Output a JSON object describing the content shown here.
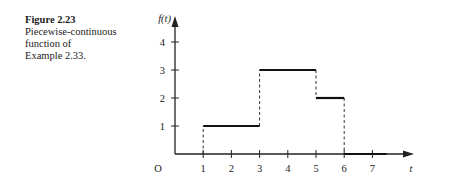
{
  "caption": {
    "figure_label": "Figure 2.23",
    "lines": [
      "Piecewise-continuous",
      "function of",
      "Example 2.33."
    ]
  },
  "chart_data": {
    "type": "line",
    "subtype": "step",
    "title": "",
    "xlabel": "t",
    "ylabel": "f(t)",
    "origin_label": "O",
    "x_ticks": [
      1,
      2,
      3,
      4,
      5,
      6,
      7
    ],
    "y_ticks": [
      1,
      2,
      3,
      4
    ],
    "xlim": [
      0,
      8
    ],
    "ylim": [
      0,
      4.5
    ],
    "grid": false,
    "segments": [
      {
        "x_start": 1,
        "x_end": 3,
        "y": 1
      },
      {
        "x_start": 3,
        "x_end": 5,
        "y": 3
      },
      {
        "x_start": 5,
        "x_end": 6,
        "y": 2
      },
      {
        "x_start": 6,
        "x_end": 7.5,
        "y": 0
      }
    ],
    "discontinuities": [
      {
        "x": 1,
        "from": 0,
        "to": 1
      },
      {
        "x": 3,
        "from": 1,
        "to": 3
      },
      {
        "x": 5,
        "from": 3,
        "to": 2
      },
      {
        "x": 6,
        "from": 2,
        "to": 0
      }
    ]
  }
}
